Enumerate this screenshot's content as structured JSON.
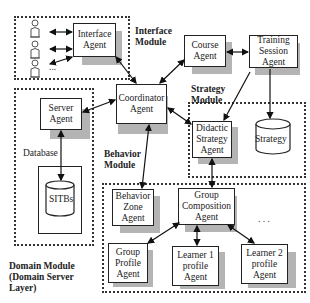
{
  "modules": {
    "interface": {
      "label": "Interface\nModule"
    },
    "strategy": {
      "label": "Strategy\nModule"
    },
    "behavior": {
      "label": "Behavior\nModule"
    },
    "domain": {
      "label": "Domain Module\n(Domain Server\n Layer)"
    }
  },
  "agents": {
    "interface": "Interface\nAgent",
    "coordinator": "Coordinator\nAgent",
    "course": "Course\nAgent",
    "training_session": "Training\nSession\nAgent",
    "server": "Server\nAgent",
    "didactic_strategy": "Didactic\nStrategy\nAgent",
    "behavior_zone": "Behavior\nZone\nAgent",
    "group_composition": "Group\nComposition\nAgent",
    "group_profile": "Group\nProfile\nAgent",
    "learner1_profile": "Learner 1\nprofile\nAgent",
    "learner2_profile": "Learner 2\nprofile\nAgent"
  },
  "databases": {
    "sitbs": "SITBs",
    "strategy": "Strategy"
  },
  "labels": {
    "database": "Database",
    "users_ellipsis": "...",
    "learners_ellipsis": ". . ."
  },
  "icons": {
    "user": "user-figure-icon",
    "database": "cylinder-database-icon"
  }
}
